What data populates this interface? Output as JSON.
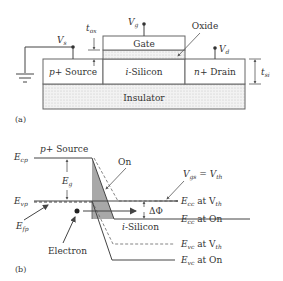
{
  "panel_a": {
    "caption": "(a)",
    "layers": {
      "gate": "Gate",
      "oxide": "Oxide",
      "source": "p+ Source",
      "channel": "i-Silicon",
      "drain": "n+ Drain",
      "insulator": "Insulator"
    },
    "terminals": {
      "vs": "V",
      "vs_sub": "s",
      "vg": "V",
      "vg_sub": "g",
      "vd": "V",
      "vd_sub": "d"
    },
    "dimensions": {
      "tox": "t",
      "tox_sub": "ox",
      "tsi": "t",
      "tsi_sub": "si"
    }
  },
  "panel_b": {
    "caption": "(b)",
    "source_label": "p+ Source",
    "ecp": "E",
    "ecp_sub": "cp",
    "evp": "E",
    "evp_sub": "vp",
    "efp": "E",
    "efp_sub": "fp",
    "eg": "E",
    "eg_sub": "g",
    "on_label": "On",
    "electron_label": "Electron",
    "channel_label": "i-Silicon",
    "delta_phi": "ΔΦ",
    "vgs_eq": "V",
    "vgs_sub": "gs",
    "vgs_eq_mid": " = V",
    "vgs_th_sub": "th",
    "ecc_vth": "E",
    "ecc_vth_sub": "cc",
    "ecc_vth_rest": " at V",
    "ecc_vth_th": "th",
    "ecc_on": "E",
    "ecc_on_sub": "cc",
    "ecc_on_rest": " at On",
    "evc_vth": "E",
    "evc_vth_sub": "vc",
    "evc_vth_rest": " at V",
    "evc_vth_th": "th",
    "evc_on": "E",
    "evc_on_sub": "vc",
    "evc_on_rest": " at On"
  }
}
